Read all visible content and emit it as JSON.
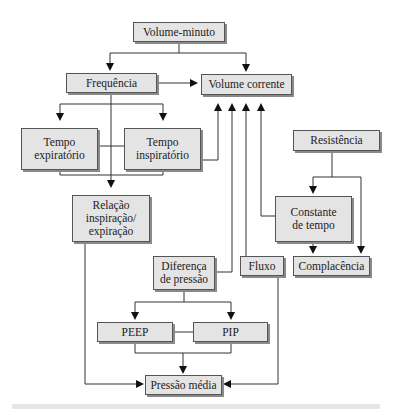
{
  "diagram": {
    "nodes": {
      "volume_minuto": "Volume-minuto",
      "frequencia": "Frequência",
      "volume_corrente": "Volume corrente",
      "tempo_expiratorio": "Tempo\nexpiratório",
      "tempo_inspiratorio": "Tempo\ninspiratório",
      "resistencia": "Resistência",
      "relacao": "Relação\ninspiração/\nexpiração",
      "constante_tempo": "Constante\nde tempo",
      "diferenca_pressao": "Diferença\nde pressão",
      "fluxo": "Fluxo",
      "complacencia": "Complacência",
      "peep": "PEEP",
      "pip": "PIP",
      "pressao_media": "Pressão média"
    },
    "edges": [
      {
        "from": "volume_minuto",
        "to": "frequencia"
      },
      {
        "from": "volume_minuto",
        "to": "volume_corrente"
      },
      {
        "from": "frequencia",
        "to": "volume_corrente"
      },
      {
        "from": "frequencia",
        "to": "tempo_expiratorio"
      },
      {
        "from": "frequencia",
        "to": "tempo_inspiratorio"
      },
      {
        "from": "frequencia",
        "to": "relacao"
      },
      {
        "from": "tempo_expiratorio",
        "to": "relacao"
      },
      {
        "from": "tempo_inspiratorio",
        "to": "relacao"
      },
      {
        "from": "tempo_inspiratorio",
        "to": "volume_corrente"
      },
      {
        "from": "diferenca_pressao",
        "to": "volume_corrente"
      },
      {
        "from": "fluxo",
        "to": "volume_corrente"
      },
      {
        "from": "constante_tempo",
        "to": "volume_corrente"
      },
      {
        "from": "resistencia",
        "to": "constante_tempo"
      },
      {
        "from": "resistencia",
        "to": "complacencia"
      },
      {
        "from": "constante_tempo",
        "to": "complacencia"
      },
      {
        "from": "diferenca_pressao",
        "to": "peep"
      },
      {
        "from": "diferenca_pressao",
        "to": "pip"
      },
      {
        "from": "peep",
        "to": "pressao_media"
      },
      {
        "from": "pip",
        "to": "pressao_media"
      },
      {
        "from": "relacao",
        "to": "pressao_media"
      },
      {
        "from": "fluxo",
        "to": "pressao_media"
      }
    ]
  }
}
